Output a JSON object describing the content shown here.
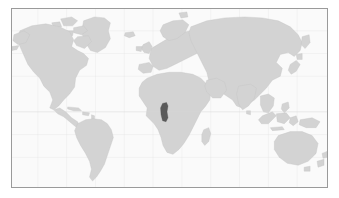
{
  "figure": {
    "kind": "world-locator-map",
    "canvas": {
      "width": 339,
      "height": 198
    },
    "frame": {
      "left": 11,
      "top": 8,
      "width": 317,
      "height": 180
    }
  },
  "colors": {
    "background": "#ffffff",
    "ocean": "#fafafa",
    "land": "#d3d3d3",
    "land_outline": "#c2c2c2",
    "highlight": "#5a5a5a",
    "frame_border": "#9a9a9a",
    "graticule": "#e2e2e2",
    "equator": "#d8d8d8"
  },
  "map": {
    "projection": "equirectangular",
    "graticule_visible": true,
    "equator_visible": true,
    "equator_y": 112,
    "highlight": {
      "name": "Cameroon",
      "region": "Central Africa",
      "bbox": {
        "x": 161,
        "y": 103,
        "width": 7,
        "height": 19
      }
    },
    "landmasses": [
      "North America",
      "Greenland",
      "Canadian Arctic Archipelago",
      "South America",
      "Africa",
      "Madagascar",
      "Europe",
      "British Isles",
      "Scandinavia",
      "Iceland",
      "Asia",
      "Japan",
      "Indonesia",
      "New Guinea",
      "Australia",
      "New Zealand",
      "Caribbean",
      "Sri Lanka",
      "Philippines"
    ]
  }
}
